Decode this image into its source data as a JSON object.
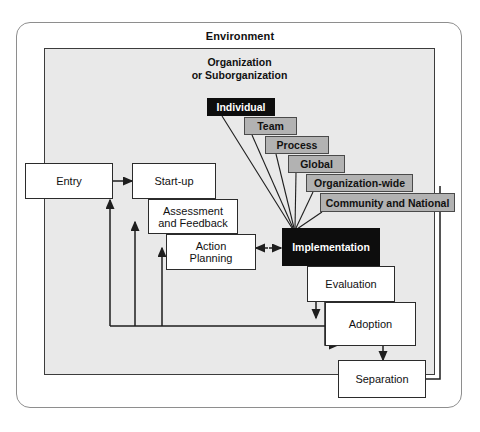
{
  "diagram": {
    "environment_label": "Environment",
    "organization_label_line1": "Organization",
    "organization_label_line2": "or Suborganization",
    "colors": {
      "organization_fill": "#e9e9e9",
      "level_box_fill": "#b2b2b2",
      "highlight_fill": "#0d0d0d",
      "node_fill": "#ffffff",
      "stroke": "#2b2b2b"
    },
    "process_nodes": [
      {
        "id": "entry",
        "label": "Entry"
      },
      {
        "id": "startup",
        "label": "Start-up"
      },
      {
        "id": "assessment",
        "label": "Assessment\nand Feedback",
        "line1": "Assessment",
        "line2": "and Feedback"
      },
      {
        "id": "action",
        "label": "Action\nPlanning",
        "line1": "Action",
        "line2": "Planning"
      },
      {
        "id": "implementation",
        "label": "Implementation"
      },
      {
        "id": "evaluation",
        "label": "Evaluation"
      },
      {
        "id": "adoption",
        "label": "Adoption"
      },
      {
        "id": "separation",
        "label": "Separation"
      }
    ],
    "intervention_levels": [
      {
        "id": "individual",
        "label": "Individual",
        "style": "black"
      },
      {
        "id": "team",
        "label": "Team",
        "style": "gray"
      },
      {
        "id": "process",
        "label": "Process",
        "style": "gray"
      },
      {
        "id": "global",
        "label": "Global",
        "style": "gray"
      },
      {
        "id": "organization-wide",
        "label": "Organization-wide",
        "style": "gray"
      },
      {
        "id": "community-national",
        "label": "Community and National",
        "style": "gray"
      }
    ]
  }
}
